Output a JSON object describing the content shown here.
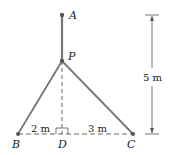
{
  "diagram": {
    "points": {
      "A": "A",
      "P": "P",
      "B": "B",
      "D": "D",
      "C": "C"
    },
    "dimensions": {
      "height": "5 m",
      "BD": "2 m",
      "DC": "3 m"
    },
    "colors": {
      "cable": "#777777",
      "dashed": "#555555",
      "point": "#555555",
      "text": "#222222"
    }
  }
}
